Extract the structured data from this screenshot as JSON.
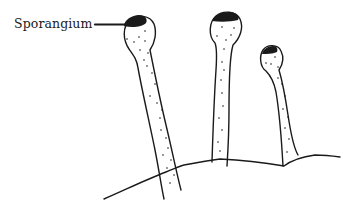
{
  "diagram": {
    "title": "",
    "labels": [
      {
        "id": "sporangium",
        "text": "Sporangium",
        "points_to": "sporangium-cap-1"
      }
    ],
    "structures": [
      {
        "id": "sporangiophore-1",
        "parts": [
          "sporangium-cap-1",
          "head-1",
          "stalk-1"
        ]
      },
      {
        "id": "sporangiophore-2",
        "parts": [
          "sporangium-cap-2",
          "head-2",
          "stalk-2"
        ]
      },
      {
        "id": "sporangiophore-3",
        "parts": [
          "sporangium-cap-3",
          "head-3",
          "stalk-3"
        ]
      },
      {
        "id": "substrate",
        "parts": [
          "ground-line"
        ]
      }
    ],
    "colors": {
      "ink": "#1a1a1a",
      "background": "#ffffff",
      "cap_fill": "#1a1a1a"
    }
  }
}
